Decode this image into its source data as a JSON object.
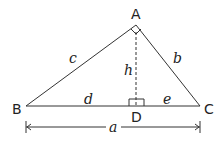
{
  "vertices": {
    "A": "A",
    "B": "B",
    "C": "C",
    "D": "D"
  },
  "sides": {
    "c": "c",
    "b": "b",
    "h": "h",
    "d": "d",
    "e": "e",
    "a": "a"
  },
  "colors": {
    "stroke": "#333333",
    "background": "#ffffff"
  }
}
